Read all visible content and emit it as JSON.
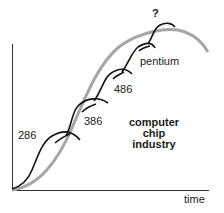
{
  "diagram": {
    "title_lines": [
      "computer",
      "chip",
      "industry"
    ],
    "x_axis_label": "time",
    "generations": [
      {
        "label": "286"
      },
      {
        "label": "386"
      },
      {
        "label": "486"
      },
      {
        "label": "pentium"
      },
      {
        "label": "?"
      }
    ],
    "colors": {
      "industry_curve": "#a6a6a6",
      "generation_curves": "#111111",
      "axes": "#333333"
    }
  }
}
